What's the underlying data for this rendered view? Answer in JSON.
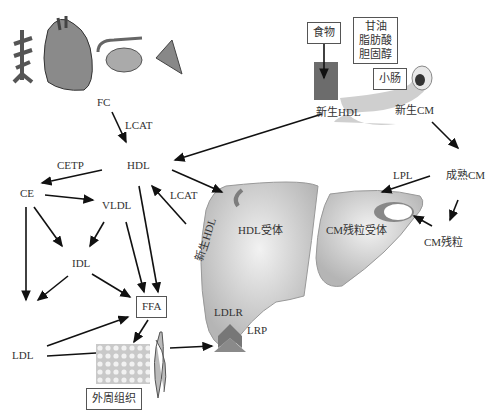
{
  "diagram": {
    "nodes": {
      "fc": "FC",
      "lcat_top": "LCAT",
      "hdl": "HDL",
      "cetp": "CETP",
      "ce": "CE",
      "vldl": "VLDL",
      "lcat_mid": "LCAT",
      "idl": "IDL",
      "ldl": "LDL",
      "ffa": "FFA",
      "peripheral": "外周组织",
      "food": "食物",
      "nutrients": [
        "甘油",
        "脂肪酸",
        "胆固醇"
      ],
      "small_intestine": "小肠",
      "nascent_hdl": "新生HDL",
      "nascent_cm": "新生CM",
      "mature_cm": "成熟CM",
      "lpl": "LPL",
      "cm_remnant": "CM残粒",
      "hdl_receptor": "HDL受体",
      "cm_remnant_receptor": "CM残粒受体",
      "nascent_hdl_vertical": "新生HDL",
      "ldlr": "LDLR",
      "lrp": "LRP"
    },
    "illustrations": [
      "blood-vessel",
      "heart",
      "kidney-adrenal",
      "tissue-wedge",
      "intestine",
      "liver",
      "adipose-tissue",
      "muscle"
    ],
    "colors": {
      "liver": "#c8c8c8",
      "receptor": "#7d7d7d",
      "arrow": "#111111"
    }
  }
}
